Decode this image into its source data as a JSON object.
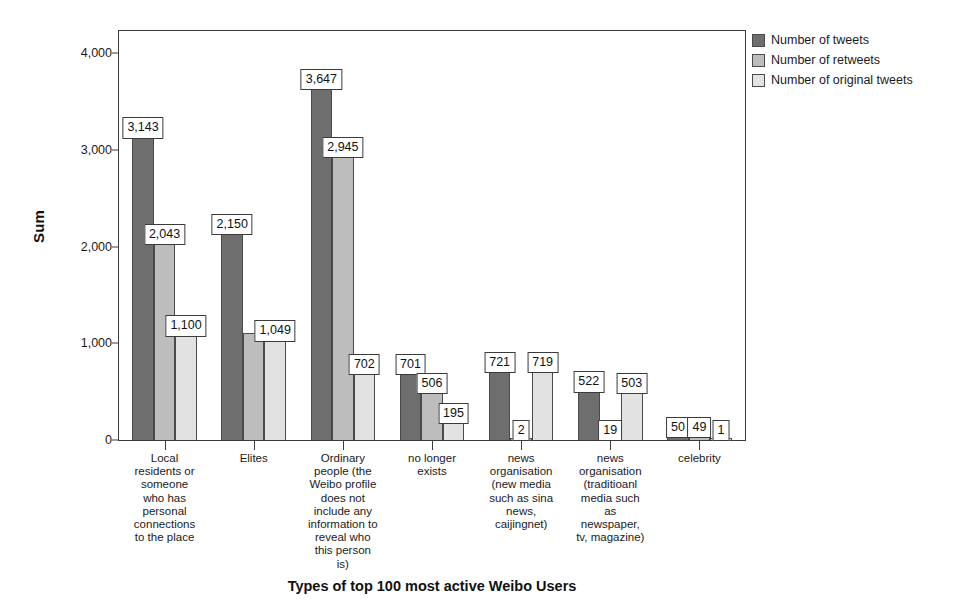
{
  "chart_data": {
    "type": "bar",
    "title": "",
    "xlabel": "Types of top 100 most active Weibo Users",
    "ylabel": "Sum",
    "ylim": [
      0,
      4000
    ],
    "ytick_labels": [
      "0",
      "1,000",
      "2,000",
      "3,000",
      "4,000"
    ],
    "ytick_values": [
      0,
      1000,
      2000,
      3000,
      4000
    ],
    "grid": false,
    "legend_position": "top-right",
    "categories": [
      "Local\nresidents or\nsomeone\nwho has\npersonal\nconnections\nto the place",
      "Elites",
      "Ordinary\npeople (the\nWeibo profile\ndoes not\ninclude any\ninformation to\nreveal who\nthis person\nis)",
      "no longer\nexists",
      "news\norganisation\n(new media\nsuch as sina\nnews,\ncaijingnet)",
      "news\norganisation\n(traditioanl\nmedia such\nas\nnewspaper,\ntv, magazine)",
      "celebrity"
    ],
    "series": [
      {
        "name": "Number of tweets",
        "color": "#6e6e6e",
        "values": [
          3143,
          2150,
          3647,
          701,
          721,
          522,
          50
        ],
        "labels": [
          "3,143",
          "2,150",
          "3,647",
          "701",
          "721",
          "522",
          "50"
        ]
      },
      {
        "name": "Number of retweets",
        "color": "#bdbdbd",
        "values": [
          2043,
          1101,
          2945,
          506,
          2,
          19,
          49
        ],
        "labels": [
          "2,043",
          "",
          "2,945",
          "506",
          "2",
          "19",
          "49"
        ]
      },
      {
        "name": "Number of original tweets",
        "color": "#e2e2e2",
        "values": [
          1100,
          1049,
          702,
          195,
          719,
          503,
          1
        ],
        "labels": [
          "1,100",
          "1,049",
          "702",
          "195",
          "719",
          "503",
          "1"
        ]
      }
    ]
  },
  "legend": {
    "items": [
      "Number of tweets",
      "Number of retweets",
      "Number of original tweets"
    ]
  },
  "axis": {
    "y_title": "Sum",
    "x_title": "Types of top 100 most active Weibo Users"
  }
}
